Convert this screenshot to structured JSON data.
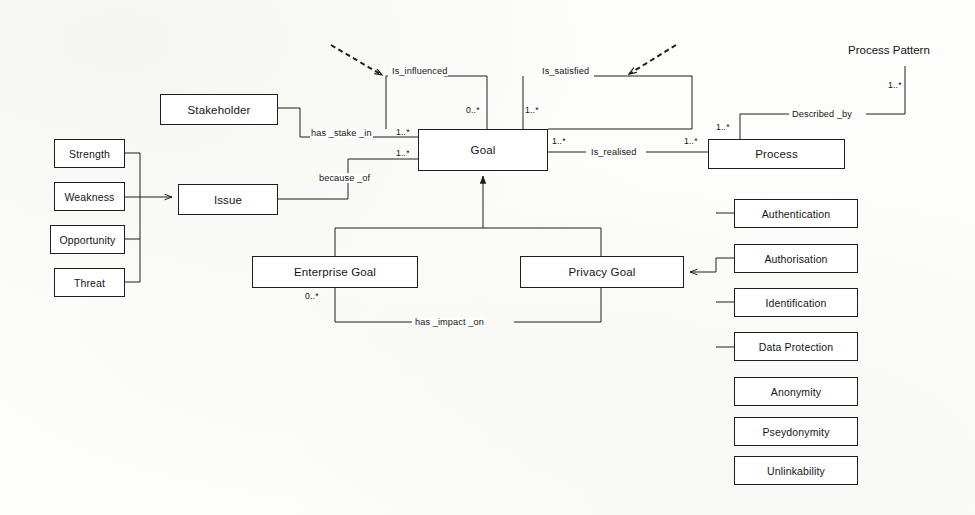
{
  "diagram": {
    "title_text": "Process Pattern",
    "nodes": [
      {
        "id": "stakeholder",
        "label": "Stakeholder",
        "x": 160,
        "y": 94,
        "w": 118,
        "h": 31
      },
      {
        "id": "strength",
        "label": "Strength",
        "x": 54,
        "y": 139,
        "w": 71,
        "h": 29
      },
      {
        "id": "weakness",
        "label": "Weakness",
        "x": 54,
        "y": 182,
        "w": 71,
        "h": 29
      },
      {
        "id": "opportunity",
        "label": "Opportunity",
        "x": 50,
        "y": 225,
        "w": 75,
        "h": 29
      },
      {
        "id": "threat",
        "label": "Threat",
        "x": 54,
        "y": 268,
        "w": 71,
        "h": 29
      },
      {
        "id": "issue",
        "label": "Issue",
        "x": 178,
        "y": 184,
        "w": 100,
        "h": 31
      },
      {
        "id": "goal",
        "label": "Goal",
        "x": 418,
        "y": 129,
        "w": 130,
        "h": 42
      },
      {
        "id": "process",
        "label": "Process",
        "x": 708,
        "y": 139,
        "w": 137,
        "h": 30
      },
      {
        "id": "enterprise_goal",
        "label": "Enterprise Goal",
        "x": 252,
        "y": 256,
        "w": 166,
        "h": 32
      },
      {
        "id": "privacy_goal",
        "label": "Privacy Goal",
        "x": 520,
        "y": 256,
        "w": 164,
        "h": 32
      },
      {
        "id": "authentication",
        "label": "Authentication",
        "x": 734,
        "y": 199,
        "w": 124,
        "h": 29
      },
      {
        "id": "authorisation",
        "label": "Authorisation",
        "x": 734,
        "y": 244,
        "w": 124,
        "h": 29
      },
      {
        "id": "identification",
        "label": "Identification",
        "x": 734,
        "y": 288,
        "w": 124,
        "h": 29
      },
      {
        "id": "data_protection",
        "label": "Data Protection",
        "x": 734,
        "y": 332,
        "w": 124,
        "h": 29
      },
      {
        "id": "anonymity",
        "label": "Anonymity",
        "x": 734,
        "y": 377,
        "w": 124,
        "h": 29
      },
      {
        "id": "pseydonymity",
        "label": "Pseydonymity",
        "x": 734,
        "y": 417,
        "w": 124,
        "h": 29
      },
      {
        "id": "unlinkability",
        "label": "Unlinkability",
        "x": 734,
        "y": 456,
        "w": 124,
        "h": 29
      }
    ],
    "edge_labels": [
      {
        "id": "is_influenced",
        "text": "Is_influenced",
        "x": 391,
        "y": 71
      },
      {
        "id": "is_satisfied",
        "text": "Is_satisfied",
        "x": 541,
        "y": 71
      },
      {
        "id": "has_stake_in",
        "text": "has _stake _in",
        "x": 310,
        "y": 133
      },
      {
        "id": "because_of",
        "text": "because _of",
        "x": 318,
        "y": 172
      },
      {
        "id": "is_realised",
        "text": "Is_realised",
        "x": 592,
        "y": 144
      },
      {
        "id": "described_by",
        "text": "Described _by",
        "x": 795,
        "y": 108
      },
      {
        "id": "has_impact_on",
        "text": "has _impact _on",
        "x": 418,
        "y": 310
      }
    ],
    "multiplicities": [
      {
        "id": "mult-influenced-goal",
        "text": "0..*",
        "x": 466,
        "y": 105
      },
      {
        "id": "mult-satisfied-goal",
        "text": "1..*",
        "x": 520,
        "y": 105
      },
      {
        "id": "mult-stake-goal",
        "text": "1..*",
        "x": 398,
        "y": 131
      },
      {
        "id": "mult-because-goal",
        "text": "1..*",
        "x": 398,
        "y": 150
      },
      {
        "id": "mult-goal-realised",
        "text": "1..*",
        "x": 552,
        "y": 138
      },
      {
        "id": "mult-realised-process",
        "text": "1..*",
        "x": 686,
        "y": 138
      },
      {
        "id": "mult-process-described",
        "text": "1..*",
        "x": 718,
        "y": 123
      },
      {
        "id": "mult-pattern-described",
        "text": "1..*",
        "x": 889,
        "y": 84
      },
      {
        "id": "mult-enterprise-impact",
        "text": "0..*",
        "x": 305,
        "y": 292
      }
    ]
  }
}
